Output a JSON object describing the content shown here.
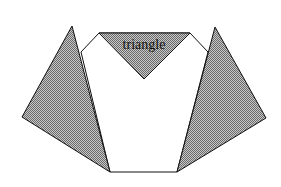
{
  "diagram": {
    "label": "triangle",
    "colors": {
      "fill": "#a8a8a8",
      "stroke": "#111111",
      "background": "#ffffff"
    },
    "shapes": {
      "left_triangle": "72,26 22,117 110,172",
      "right_triangle": "215,27 266,118 177,172",
      "center_triangle": "99,33 190,33 144,79",
      "white_polygon": "81,52 99,33 190,33 208,52 177,172 110,172"
    }
  }
}
